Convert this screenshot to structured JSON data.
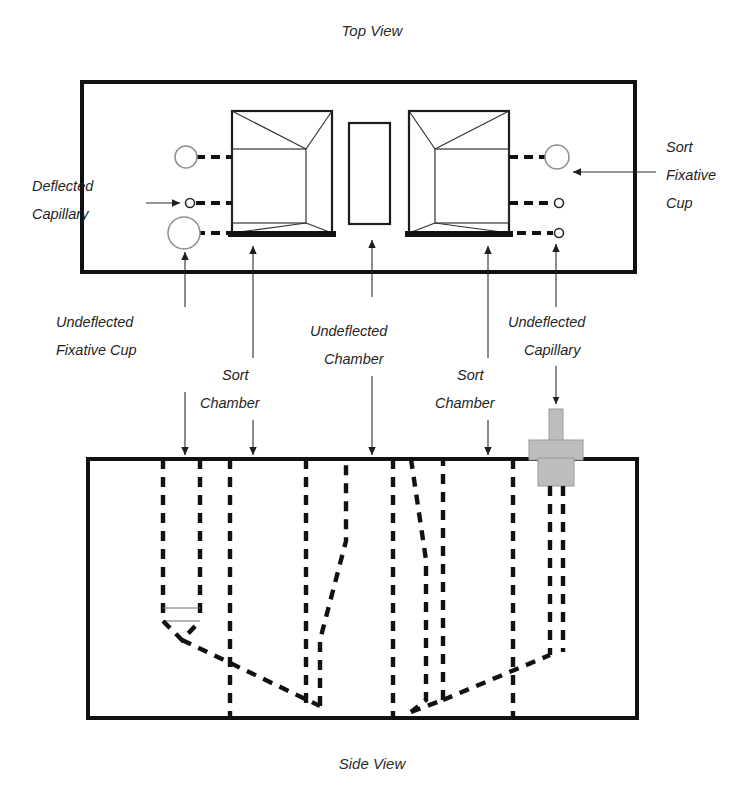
{
  "figure": {
    "top_view_title": "Top View",
    "side_view_title": "Side View"
  },
  "labels": {
    "deflected_capillary_line1": "Deflected",
    "deflected_capillary_line2": "Capillary",
    "sort_fixative_cup_line1": "Sort",
    "sort_fixative_cup_line2": "Fixative",
    "sort_fixative_cup_line3": "Cup",
    "undeflected_fixative_cup_line1": "Undeflected",
    "undeflected_fixative_cup_line2": "Fixative Cup",
    "sort_chamber_left_line1": "Sort",
    "sort_chamber_left_line2": "Chamber",
    "undeflected_chamber_line1": "Undeflected",
    "undeflected_chamber_line2": "Chamber",
    "sort_chamber_right_line1": "Sort",
    "sort_chamber_right_line2": "Chamber",
    "undeflected_capillary_line1": "Undeflected",
    "undeflected_capillary_line2": "Capillary"
  },
  "colors": {
    "ink": "#111111",
    "background": "#ffffff",
    "gray_fixture": "#bdbdbd",
    "leader_line": "#2d2d2d"
  },
  "icons": {
    "arrow_down": "arrow-down-icon",
    "arrow_up": "arrow-up-icon",
    "arrow_left": "arrow-left-icon",
    "arrow_right": "arrow-right-icon"
  }
}
